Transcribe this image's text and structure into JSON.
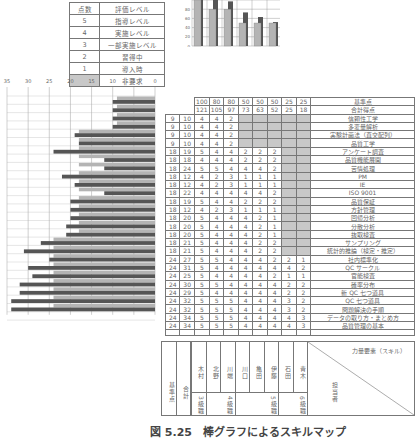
{
  "legend": {
    "header": {
      "score": "点数",
      "level": "評価レベル"
    },
    "rows": [
      {
        "score": "5",
        "level": "指導レベル"
      },
      {
        "score": "4",
        "level": "実施レベル"
      },
      {
        "score": "3",
        "level": "一部実施レベル"
      },
      {
        "score": "2",
        "level": "習得中"
      },
      {
        "score": "1",
        "level": "導入時"
      },
      {
        "score": "",
        "level": "非要求",
        "shaded": true
      }
    ]
  },
  "table": {
    "header_standard_label": "基準点",
    "header_total_label": "合計得点",
    "standard_points": [
      "100",
      "80",
      "80",
      "50",
      "50",
      "50",
      "25",
      "25"
    ],
    "total_points": [
      "121",
      "105",
      "97",
      "73",
      "63",
      "52",
      "25",
      "18"
    ],
    "rows": [
      {
        "std": "9",
        "sum": "10",
        "vals": [
          "4",
          "4",
          "2",
          "",
          "",
          "",
          "",
          ""
        ],
        "skill": "信頼性工学"
      },
      {
        "std": "9",
        "sum": "10",
        "vals": [
          "4",
          "4",
          "2",
          "",
          "",
          "",
          "",
          ""
        ],
        "skill": "多変量解析"
      },
      {
        "std": "9",
        "sum": "10",
        "vals": [
          "4",
          "4",
          "2",
          "",
          "",
          "",
          "",
          ""
        ],
        "skill": "実験計画法（直交配列）"
      },
      {
        "std": "9",
        "sum": "10",
        "vals": [
          "4",
          "4",
          "2",
          "",
          "",
          "",
          "",
          ""
        ],
        "skill": "品質工学"
      },
      {
        "std": "18",
        "sum": "19",
        "vals": [
          "5",
          "4",
          "4",
          "2",
          "2",
          "2",
          "",
          ""
        ],
        "skill": "アンケート調査"
      },
      {
        "std": "18",
        "sum": "18",
        "vals": [
          "4",
          "4",
          "4",
          "2",
          "2",
          "2",
          "",
          ""
        ],
        "skill": "品質機能展開"
      },
      {
        "std": "18",
        "sum": "24",
        "vals": [
          "5",
          "5",
          "4",
          "4",
          "4",
          "2",
          "",
          ""
        ],
        "skill": "苦情処理"
      },
      {
        "std": "18",
        "sum": "12",
        "vals": [
          "4",
          "2",
          "3",
          "1",
          "1",
          "1",
          "",
          ""
        ],
        "skill": "PM"
      },
      {
        "std": "18",
        "sum": "12",
        "vals": [
          "4",
          "2",
          "3",
          "1",
          "1",
          "1",
          "",
          ""
        ],
        "skill": "IE"
      },
      {
        "std": "18",
        "sum": "22",
        "vals": [
          "4",
          "4",
          "4",
          "4",
          "4",
          "2",
          "",
          ""
        ],
        "skill": "ISO 9001"
      },
      {
        "std": "18",
        "sum": "19",
        "vals": [
          "5",
          "4",
          "4",
          "2",
          "2",
          "2",
          "",
          ""
        ],
        "skill": "品質保証"
      },
      {
        "std": "18",
        "sum": "12",
        "vals": [
          "4",
          "2",
          "3",
          "1",
          "1",
          "1",
          "",
          ""
        ],
        "skill": "方針管理"
      },
      {
        "std": "18",
        "sum": "20",
        "vals": [
          "5",
          "4",
          "4",
          "4",
          "2",
          "1",
          "",
          ""
        ],
        "skill": "回帰分析"
      },
      {
        "std": "18",
        "sum": "20",
        "vals": [
          "5",
          "4",
          "4",
          "4",
          "2",
          "1",
          "",
          ""
        ],
        "skill": "分散分析"
      },
      {
        "std": "18",
        "sum": "20",
        "vals": [
          "5",
          "4",
          "4",
          "4",
          "2",
          "1",
          "",
          ""
        ],
        "skill": "抜取検査"
      },
      {
        "std": "18",
        "sum": "21",
        "vals": [
          "5",
          "4",
          "4",
          "4",
          "2",
          "2",
          "",
          ""
        ],
        "skill": "サンプリング"
      },
      {
        "std": "18",
        "sum": "21",
        "vals": [
          "5",
          "4",
          "4",
          "4",
          "2",
          "2",
          "",
          ""
        ],
        "skill": "統計的推論（検定・推定）"
      },
      {
        "std": "24",
        "sum": "27",
        "vals": [
          "5",
          "5",
          "4",
          "4",
          "4",
          "2",
          "2",
          "1"
        ],
        "skill": "社内標準化"
      },
      {
        "std": "24",
        "sum": "31",
        "vals": [
          "5",
          "4",
          "4",
          "4",
          "4",
          "4",
          "4",
          "2"
        ],
        "skill": "QC サークル"
      },
      {
        "std": "24",
        "sum": "25",
        "vals": [
          "5",
          "4",
          "4",
          "4",
          "4",
          "2",
          "1",
          "1"
        ],
        "skill": "官能検査"
      },
      {
        "std": "24",
        "sum": "30",
        "vals": [
          "5",
          "5",
          "4",
          "4",
          "4",
          "4",
          "2",
          "2"
        ],
        "skill": "確率分布"
      },
      {
        "std": "24",
        "sum": "29",
        "vals": [
          "5",
          "4",
          "4",
          "4",
          "4",
          "4",
          "2",
          "2"
        ],
        "skill": "新 QC 七つ道具"
      },
      {
        "std": "24",
        "sum": "32",
        "vals": [
          "5",
          "5",
          "5",
          "4",
          "4",
          "4",
          "3",
          "2"
        ],
        "skill": "QC 七つ道具"
      },
      {
        "std": "24",
        "sum": "32",
        "vals": [
          "5",
          "5",
          "5",
          "4",
          "4",
          "4",
          "3",
          "2"
        ],
        "skill": "問題解決の手順"
      },
      {
        "std": "24",
        "sum": "34",
        "vals": [
          "5",
          "5",
          "5",
          "4",
          "4",
          "4",
          "4",
          "3"
        ],
        "skill": "データの取り方・まとめ方"
      },
      {
        "std": "24",
        "sum": "34",
        "vals": [
          "5",
          "5",
          "5",
          "4",
          "4",
          "4",
          "4",
          "3"
        ],
        "skill": "品質管理の基本"
      }
    ]
  },
  "bottom": {
    "standard_label": "基準点",
    "total_label": "合計",
    "names": [
      "木村",
      "北野",
      "川端",
      "川口",
      "亀田",
      "伊藤",
      "石田",
      "青木"
    ],
    "grades": [
      {
        "label": "3級職",
        "span": 1
      },
      {
        "label": "4級職",
        "span": 2
      },
      {
        "label": "5級職",
        "span": 3
      },
      {
        "label": "6級職",
        "span": 2
      }
    ],
    "skill_axis_label": "力量要素（スキル）",
    "person_axis_label": "担当者"
  },
  "caption": "図 5.25　棒グラフによるスキルマップ",
  "colors": {
    "dark_bar": "#555555",
    "light_bar": "#b4b4b4",
    "shade": "#c8c8c8",
    "border": "#777777"
  },
  "chart_data": [
    {
      "type": "bar",
      "title": "",
      "categories": [
        "木村",
        "北野",
        "川端",
        "川口",
        "亀田",
        "伊藤"
      ],
      "series": [
        {
          "name": "基準点",
          "values": [
            100,
            80,
            80,
            50,
            50,
            50
          ]
        },
        {
          "name": "合計得点",
          "values": [
            121,
            105,
            97,
            73,
            63,
            52
          ]
        }
      ],
      "yticks": [
        "0",
        "20",
        "40",
        "60",
        "80"
      ],
      "ylim": [
        0,
        100
      ],
      "grid": true
    },
    {
      "type": "bar",
      "orientation": "horizontal",
      "title": "",
      "xticks": [
        "35",
        "30",
        "25",
        "20",
        "15",
        "10",
        "5",
        "0"
      ],
      "xlim": [
        35,
        0
      ],
      "categories": [
        "信頼性工学",
        "多変量解析",
        "実験計画法（直交配列）",
        "品質工学",
        "アンケート調査",
        "品質機能展開",
        "苦情処理",
        "PM",
        "IE",
        "ISO 9001",
        "品質保証",
        "方針管理",
        "回帰分析",
        "分散分析",
        "抜取検査",
        "サンプリング",
        "統計的推論（検定・推定）",
        "社内標準化",
        "QC サークル",
        "官能検査",
        "確率分布",
        "新 QC 七つ道具",
        "QC 七つ道具",
        "問題解決の手順",
        "データの取り方・まとめ方",
        "品質管理の基本"
      ],
      "series": [
        {
          "name": "基準点",
          "values": [
            9,
            9,
            9,
            9,
            18,
            18,
            18,
            18,
            18,
            18,
            18,
            18,
            18,
            18,
            18,
            18,
            18,
            24,
            24,
            24,
            24,
            24,
            24,
            24,
            24,
            24
          ]
        },
        {
          "name": "合計",
          "values": [
            10,
            10,
            10,
            10,
            19,
            18,
            24,
            12,
            12,
            22,
            19,
            12,
            20,
            20,
            20,
            21,
            21,
            27,
            31,
            25,
            30,
            29,
            32,
            32,
            34,
            34
          ]
        }
      ],
      "grid": true
    }
  ]
}
